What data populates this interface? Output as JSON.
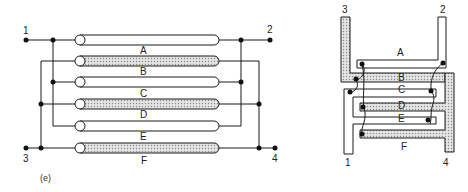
{
  "caption": "(e)",
  "colors": {
    "line": "#1a1a1a",
    "shade": "#c8c8c8",
    "background": "#ffffff"
  },
  "left_diagram": {
    "terminals": {
      "t1": "1",
      "t2": "2",
      "t3": "3",
      "t4": "4"
    },
    "conductor_labels": [
      "A",
      "B",
      "C",
      "D",
      "E",
      "F"
    ],
    "tubes": [
      {
        "y": 40,
        "shaded": false
      },
      {
        "y": 61,
        "shaded": true
      },
      {
        "y": 82,
        "shaded": false
      },
      {
        "y": 104,
        "shaded": true
      },
      {
        "y": 126,
        "shaded": false
      },
      {
        "y": 148,
        "shaded": true
      }
    ]
  },
  "right_diagram": {
    "terminals": {
      "t1": "1",
      "t2": "2",
      "t3": "3",
      "t4": "4"
    },
    "conductor_labels": [
      "A",
      "B",
      "C",
      "D",
      "E",
      "F"
    ]
  }
}
